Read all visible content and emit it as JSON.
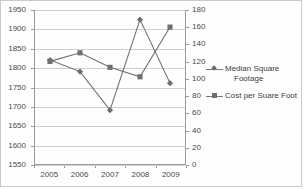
{
  "chart_data": {
    "type": "line",
    "title": "",
    "xlabel": "",
    "ylabel": "",
    "grid": true,
    "legend_position": "right",
    "categories": [
      "2005",
      "2006",
      "2007",
      "2008",
      "2009"
    ],
    "axes": {
      "left": {
        "min": 1550,
        "max": 1950,
        "step": 50,
        "ticks": [
          "1950",
          "1900",
          "1850",
          "1800",
          "1750",
          "1700",
          "1650",
          "1600",
          "1550"
        ]
      },
      "right": {
        "min": 0,
        "max": 180,
        "step": 20,
        "ticks": [
          "180",
          "160",
          "140",
          "120",
          "100",
          "80",
          "60",
          "40",
          "20",
          "0"
        ]
      }
    },
    "series": [
      {
        "name": "Median Square Footage",
        "axis": "left",
        "marker": "diamond",
        "color": "#6e6e6e",
        "values": [
          1820,
          1790,
          1690,
          1925,
          1760
        ]
      },
      {
        "name": "Cost per Suare Foot",
        "axis": "right",
        "marker": "square",
        "color": "#6e6e6e",
        "values": [
          120,
          130,
          113,
          102,
          160
        ]
      }
    ]
  },
  "legend": {
    "entries": [
      {
        "label_line1": "Median Square",
        "label_line2": "Footage",
        "marker": "diamond-marker-icon"
      },
      {
        "label_line1": "Cost per Suare Foot",
        "label_line2": "",
        "marker": "square-marker-icon"
      }
    ]
  },
  "colors": {
    "series": "#6e6e6e",
    "gridline": "#d0d0d0",
    "axis": "#9a9a9a",
    "text": "#4a4a4a",
    "frame": "#c9c9c9"
  }
}
